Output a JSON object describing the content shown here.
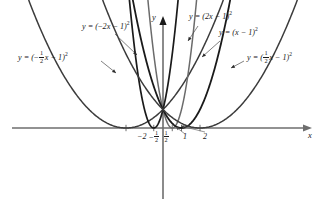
{
  "figure": {
    "axes": {
      "x_label": "x",
      "y_label": "y",
      "origin_px": [
        163,
        128
      ],
      "x_px_per_unit": 18.5,
      "y_px_per_unit": 18.5,
      "x_range": [
        -8.2,
        7.7
      ],
      "y_range": [
        -4.6,
        6.9
      ],
      "grid": false
    },
    "x_ticks": [
      {
        "value": -2,
        "label_text": "-2",
        "display": "minus-two",
        "x_px": 144
      },
      {
        "value": -0.5,
        "label_text": "-1/2",
        "display": "minus-one-half",
        "x_px": 155
      },
      {
        "value": 0.5,
        "label_text": "1/2",
        "display": "one-half",
        "x_px": 167
      },
      {
        "value": 1,
        "label_text": "1",
        "display": "one",
        "x_px": 185
      },
      {
        "value": 2,
        "label_text": "2",
        "display": "two",
        "x_px": 205
      }
    ],
    "curve_color_dark": "#1a1a1a",
    "curve_color_mid": "#4d4d4d",
    "curve_color_gray": "#7a7a7a",
    "axis_color": "#6e6e6e",
    "curves": [
      {
        "id": "a-neg-half",
        "coefficient": -0.5,
        "equation_text": "y = (-1/2 x - 1)^2",
        "vertex": [
          -2,
          0
        ],
        "color": "#3c3c3c",
        "width": 1.5,
        "label_pos_px": [
          18,
          54
        ],
        "leader_from_px": [
          101,
          61
        ],
        "leader_to_px": [
          116,
          73
        ]
      },
      {
        "id": "a-neg-2",
        "coefficient": -2,
        "equation_text": "y = (-2x - 1)^2",
        "vertex": [
          -0.5,
          0
        ],
        "color": "#1a1a1a",
        "width": 1.7,
        "label_pos_px": [
          82,
          25
        ],
        "leader_from_px": [
          115,
          34
        ],
        "leader_to_px": [
          137,
          55
        ]
      },
      {
        "id": "a-2",
        "coefficient": 2,
        "equation_text": "y = (2x - 1)^2",
        "vertex": [
          0.5,
          0
        ],
        "color": "#6b6b6b",
        "width": 1.5,
        "label_pos_px": [
          189,
          14
        ],
        "leader_from_px": [
          198,
          26
        ],
        "leader_to_px": [
          188,
          41
        ]
      },
      {
        "id": "a-1",
        "coefficient": 1,
        "equation_text": "y = (x - 1)^2",
        "vertex": [
          1,
          0
        ],
        "color": "#1a1a1a",
        "width": 1.8,
        "label_pos_px": [
          221,
          31
        ],
        "leader_from_px": [
          220,
          41
        ],
        "leader_to_px": [
          202,
          57
        ]
      },
      {
        "id": "a-half",
        "coefficient": 0.5,
        "equation_text": "y = (1/2 x - 1)^2",
        "vertex": [
          2,
          0
        ],
        "color": "#3c3c3c",
        "width": 1.5,
        "label_pos_px": [
          246,
          54
        ],
        "leader_from_px": [
          244,
          61
        ],
        "leader_to_px": [
          231,
          68
        ]
      }
    ],
    "vertex_leaders": [
      {
        "id": "leader-one",
        "from_px": [
          185,
          134
        ],
        "to_px": [
          176,
          127
        ]
      },
      {
        "id": "leader-two",
        "from_px": [
          205,
          132
        ],
        "to_px": [
          181,
          126
        ]
      }
    ]
  },
  "chart_data": {
    "type": "line",
    "xlabel": "x",
    "ylabel": "y",
    "xlim": [
      -8.2,
      7.7
    ],
    "ylim": [
      -4.6,
      6.9
    ],
    "grid": false,
    "legend": "inline-labels",
    "function_family": "y = (a*x - 1)^2",
    "series": [
      {
        "name": "y = (-1/2 x - 1)^2",
        "a": -0.5,
        "vertex_x": -2,
        "vertex_y": 0,
        "opens": "up",
        "width_factor": 4
      },
      {
        "name": "y = (-2x - 1)^2",
        "a": -2,
        "vertex_x": -0.5,
        "vertex_y": 0,
        "opens": "up",
        "width_factor": 0.25
      },
      {
        "name": "y = (2x - 1)^2",
        "a": 2,
        "vertex_x": 0.5,
        "vertex_y": 0,
        "opens": "up",
        "width_factor": 0.25
      },
      {
        "name": "y = (x - 1)^2",
        "a": 1,
        "vertex_x": 1,
        "vertex_y": 0,
        "opens": "up",
        "width_factor": 1
      },
      {
        "name": "y = (1/2 x - 1)^2",
        "a": 0.5,
        "vertex_x": 2,
        "vertex_y": 0,
        "opens": "up",
        "width_factor": 4
      }
    ],
    "x_tick_values": [
      -2,
      -0.5,
      0.5,
      1,
      2
    ],
    "x_tick_labels": [
      "-2",
      "-1/2",
      "1/2",
      "1",
      "2"
    ]
  }
}
